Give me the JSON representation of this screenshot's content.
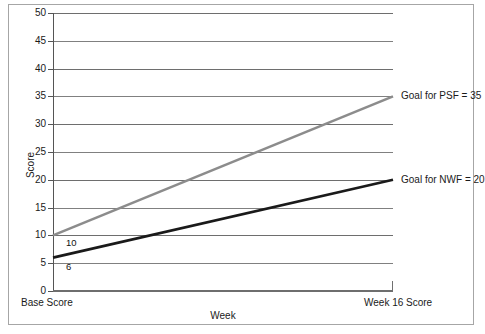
{
  "chart_data": {
    "type": "line",
    "title": "",
    "xlabel": "Week",
    "ylabel": "Score",
    "ylim": [
      0,
      50
    ],
    "yticks": [
      0,
      5,
      10,
      15,
      20,
      25,
      30,
      35,
      40,
      45,
      50
    ],
    "grid": true,
    "legend": "none",
    "x": [
      "Base Score",
      "Week 16 Score"
    ],
    "xtick_labels": [
      "Base Score",
      "Week 16 Score"
    ],
    "series": [
      {
        "name": "PSF",
        "color": "#8c8c8c",
        "values": [
          10,
          35
        ],
        "start_label": "10",
        "end_annotation": "Goal for PSF = 35"
      },
      {
        "name": "NWF",
        "color": "#1a1a1a",
        "values": [
          6,
          20
        ],
        "start_label": "6",
        "end_annotation": "Goal for NWF = 20"
      }
    ],
    "annotations": [
      {
        "text": "Goal for PSF = 35",
        "value": 35
      },
      {
        "text": "Goal for NWF = 20",
        "value": 20
      }
    ]
  },
  "axes": {
    "y_title": "Score",
    "x_title": "Week",
    "y_tick_labels": [
      "50",
      "45",
      "40",
      "35",
      "30",
      "25",
      "20",
      "15",
      "10",
      "5",
      "0"
    ],
    "x_label_left": "Base Score",
    "x_label_right": "Week 16 Score"
  },
  "labels": {
    "psf_start": "10",
    "nwf_start": "6",
    "psf_goal": "Goal for PSF = 35",
    "nwf_goal": "Goal for NWF = 20"
  },
  "colors": {
    "psf_line": "#8c8c8c",
    "nwf_line": "#1a1a1a",
    "gridline": "#808080",
    "axis": "#555555",
    "border": "#a6a6a6",
    "background": "#ffffff"
  }
}
